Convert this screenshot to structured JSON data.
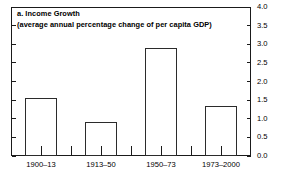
{
  "figure": {
    "panel_label": "a. Income Growth",
    "subtitle": "(average annual percentage change of per capita GDP)"
  },
  "chart_data": {
    "type": "bar",
    "title": "a. Income Growth",
    "subtitle": "(average annual percentage change of per capita GDP)",
    "categories": [
      "1900–13",
      "1913–50",
      "1950–73",
      "1973–2000"
    ],
    "values": [
      1.55,
      0.9,
      2.9,
      1.35
    ],
    "xlabel": "",
    "ylabel": "",
    "ylim": [
      0.0,
      4.0
    ],
    "ytick_labels": [
      "0.0",
      "0.5",
      "1.0",
      "1.5",
      "2.0",
      "2.5",
      "3.0",
      "3.5",
      "4.0"
    ],
    "ytick_values": [
      0.0,
      0.5,
      1.0,
      1.5,
      2.0,
      2.5,
      3.0,
      3.5,
      4.0
    ],
    "y_axis_side": "right",
    "grid": false,
    "legend": null,
    "bar_style": {
      "fill": "#ffffff",
      "edge_color": "#2b2b2b"
    }
  }
}
